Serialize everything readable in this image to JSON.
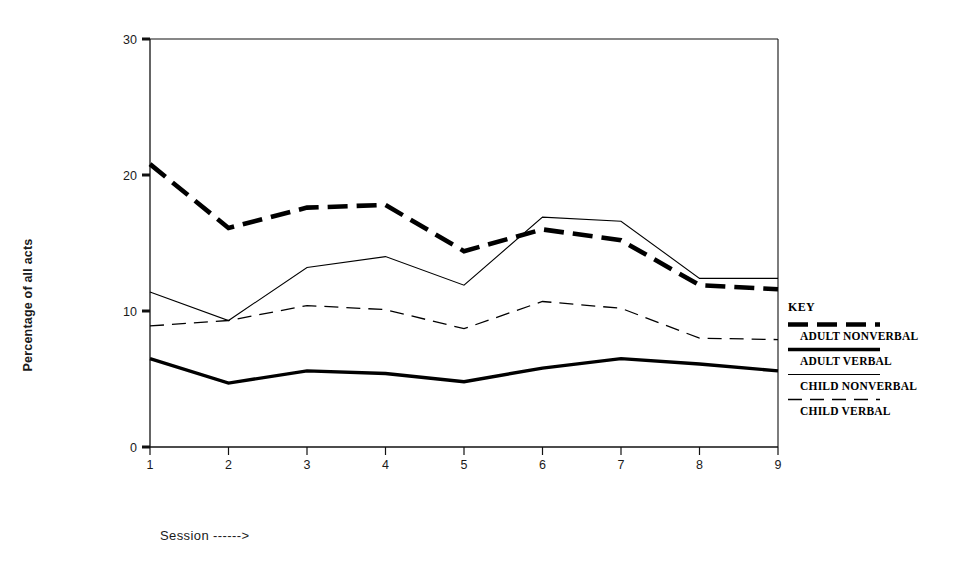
{
  "chart_data": {
    "type": "line",
    "title": "",
    "xlabel": "Session ------>",
    "ylabel": "Percentage of all acts",
    "x": [
      1,
      2,
      3,
      4,
      5,
      6,
      7,
      8,
      9
    ],
    "categories": [
      "1",
      "2",
      "3",
      "4",
      "5",
      "6",
      "7",
      "8",
      "9"
    ],
    "xlim": [
      1,
      9
    ],
    "ylim": [
      0,
      30
    ],
    "yticks": [
      0,
      10,
      20,
      30
    ],
    "ytick_labels": [
      "0",
      "10",
      "20",
      "30"
    ],
    "xticks": [
      1,
      2,
      3,
      4,
      5,
      6,
      7,
      8,
      9
    ],
    "xtick_labels": [
      "1",
      "2",
      "3",
      "4",
      "5",
      "6",
      "7",
      "8",
      "9"
    ],
    "grid": false,
    "legend_position": "right",
    "legend_title": "KEY",
    "series": [
      {
        "name": "ADULT NONVERBAL",
        "style": "thick-dashed",
        "color": "#000000",
        "values": [
          20.8,
          16.1,
          17.6,
          17.8,
          14.4,
          16.0,
          15.2,
          11.9,
          11.6
        ]
      },
      {
        "name": "ADULT VERBAL",
        "style": "thick-solid",
        "color": "#000000",
        "values": [
          6.5,
          4.7,
          5.6,
          5.4,
          4.8,
          5.8,
          6.5,
          6.1,
          5.6
        ]
      },
      {
        "name": "CHILD NONVERBAL",
        "style": "thin-solid",
        "color": "#000000",
        "values": [
          11.4,
          9.3,
          13.2,
          14.0,
          11.9,
          16.9,
          16.6,
          12.4,
          12.4
        ]
      },
      {
        "name": "CHILD VERBAL",
        "style": "thin-dashed",
        "color": "#000000",
        "values": [
          8.9,
          9.3,
          10.4,
          10.1,
          8.7,
          10.7,
          10.2,
          8.0,
          7.9
        ]
      }
    ]
  },
  "axis": {
    "y_title": "Percentage of all acts",
    "x_title": "Session ------>"
  },
  "legend": {
    "title": "KEY",
    "entries": [
      {
        "label": "ADULT NONVERBAL",
        "style": "thick-dashed"
      },
      {
        "label": "ADULT VERBAL",
        "style": "thick-solid"
      },
      {
        "label": "CHILD NONVERBAL",
        "style": "thin-solid"
      },
      {
        "label": "CHILD VERBAL",
        "style": "thin-dashed"
      }
    ]
  }
}
